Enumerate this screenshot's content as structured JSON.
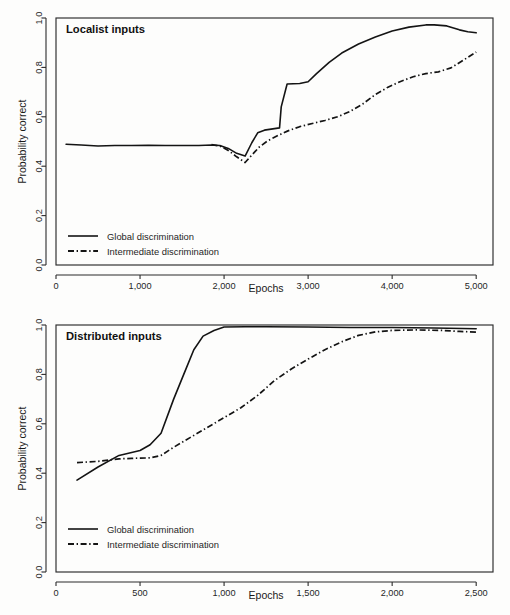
{
  "figure": {
    "background": "#fdfdfc",
    "ink": "#141414"
  },
  "chart_data": [
    {
      "type": "line",
      "panel_id": "localist",
      "title": "Localist inputs",
      "xlabel": "Epochs",
      "ylabel": "Probability correct",
      "xlim": [
        0,
        5200
      ],
      "ylim": [
        0.0,
        1.0
      ],
      "grid": false,
      "legend_position": "bottom-left",
      "xticks": [
        0,
        1000,
        2000,
        3000,
        4000,
        5000
      ],
      "xtick_labels": [
        "0",
        "1,000",
        "2,000",
        "3,000",
        "4,000",
        "5,000"
      ],
      "yticks": [
        0.0,
        0.2,
        0.4,
        0.6,
        0.8,
        1.0
      ],
      "ytick_labels": [
        "0.0",
        "0.2",
        "0.4",
        "0.6",
        "0.8",
        "1.0"
      ],
      "series": [
        {
          "name": "Global discrimination",
          "style": "solid",
          "x": [
            120,
            300,
            500,
            700,
            900,
            1100,
            1300,
            1500,
            1700,
            1850,
            1950,
            2050,
            2150,
            2250,
            2330,
            2400,
            2480,
            2600,
            2660,
            2680,
            2750,
            2900,
            3000,
            3100,
            3250,
            3400,
            3600,
            3800,
            4000,
            4200,
            4400,
            4500,
            4650,
            4800,
            4900,
            5000
          ],
          "y": [
            0.489,
            0.486,
            0.482,
            0.484,
            0.484,
            0.485,
            0.484,
            0.484,
            0.484,
            0.486,
            0.484,
            0.472,
            0.452,
            0.441,
            0.495,
            0.535,
            0.546,
            0.552,
            0.555,
            0.64,
            0.733,
            0.735,
            0.742,
            0.775,
            0.82,
            0.858,
            0.895,
            0.923,
            0.947,
            0.963,
            0.972,
            0.972,
            0.968,
            0.952,
            0.944,
            0.94
          ]
        },
        {
          "name": "Intermediate discrimination",
          "style": "dashdot",
          "x": [
            1850,
            1950,
            2050,
            2150,
            2250,
            2330,
            2420,
            2520,
            2640,
            2760,
            2900,
            3050,
            3200,
            3350,
            3500,
            3650,
            3800,
            3950,
            4100,
            4250,
            4400,
            4550,
            4700,
            4850,
            5000
          ],
          "y": [
            0.487,
            0.482,
            0.464,
            0.438,
            0.415,
            0.445,
            0.478,
            0.503,
            0.524,
            0.543,
            0.56,
            0.573,
            0.585,
            0.6,
            0.622,
            0.652,
            0.69,
            0.72,
            0.743,
            0.762,
            0.775,
            0.782,
            0.798,
            0.83,
            0.862
          ]
        }
      ]
    },
    {
      "type": "line",
      "panel_id": "distributed",
      "title": "Distributed inputs",
      "xlabel": "Epochs",
      "ylabel": "Probability correct",
      "xlim": [
        0,
        2600
      ],
      "ylim": [
        0.0,
        1.0
      ],
      "grid": false,
      "legend_position": "bottom-left",
      "xticks": [
        0,
        500,
        1000,
        1500,
        2000,
        2500
      ],
      "xtick_labels": [
        "0",
        "500",
        "1,000",
        "1,500",
        "2,000",
        "2,500"
      ],
      "yticks": [
        0.0,
        0.2,
        0.4,
        0.6,
        0.8,
        1.0
      ],
      "ytick_labels": [
        "0.0",
        "0.2",
        "0.4",
        "0.6",
        "0.8",
        "1.0"
      ],
      "series": [
        {
          "name": "Global discrimination",
          "style": "solid",
          "x": [
            125,
            250,
            375,
            500,
            560,
            625,
            700,
            760,
            820,
            875,
            940,
            1000,
            1125,
            1250,
            1500,
            1750,
            2000,
            2250,
            2500
          ],
          "y": [
            0.372,
            0.425,
            0.472,
            0.492,
            0.515,
            0.562,
            0.7,
            0.8,
            0.9,
            0.955,
            0.978,
            0.992,
            0.993,
            0.993,
            0.992,
            0.99,
            0.99,
            0.988,
            0.985
          ]
        },
        {
          "name": "Intermediate discrimination",
          "style": "dashdot",
          "x": [
            125,
            250,
            375,
            450,
            500,
            560,
            625,
            700,
            800,
            900,
            1000,
            1100,
            1200,
            1300,
            1400,
            1500,
            1600,
            1700,
            1800,
            1900,
            2000,
            2150,
            2300,
            2400,
            2500
          ],
          "y": [
            0.443,
            0.448,
            0.458,
            0.46,
            0.461,
            0.462,
            0.472,
            0.505,
            0.545,
            0.585,
            0.625,
            0.665,
            0.715,
            0.775,
            0.822,
            0.862,
            0.9,
            0.932,
            0.958,
            0.972,
            0.978,
            0.98,
            0.978,
            0.974,
            0.971
          ]
        }
      ]
    }
  ]
}
